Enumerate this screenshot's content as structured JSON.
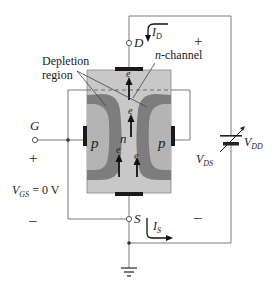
{
  "diagram": {
    "terminals": {
      "drain": "D",
      "gate": "G",
      "source": "S"
    },
    "labels": {
      "depletion_region_line1": "Depletion",
      "depletion_region_line2": "region",
      "n_channel": "n-channel",
      "p_left": "p",
      "p_right": "p",
      "n_center": "n",
      "electron": "e",
      "vds_main": "V",
      "vds_sub": "DS",
      "vdd_main": "V",
      "vdd_sub": "DD",
      "vgs_main": "V",
      "vgs_sub": "GS",
      "vgs_value": " = 0 V",
      "id_main": "I",
      "id_sub": "D",
      "is_main": "I",
      "is_sub": "S",
      "plus_right": "+",
      "minus_right": "–",
      "plus_left": "+",
      "minus_left": "–"
    },
    "colors": {
      "channel": "#c8c8c8",
      "depletion": "#7d7d7d",
      "p_region": "#b4b4b4",
      "wire": "#7a7a7a",
      "contact": "#1a1a1a"
    }
  }
}
